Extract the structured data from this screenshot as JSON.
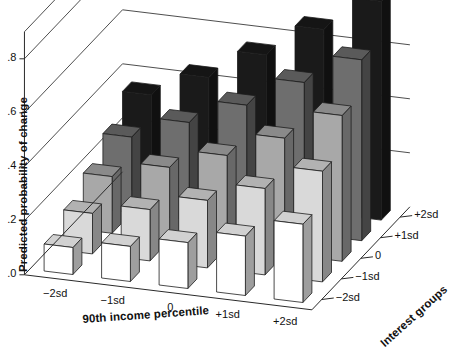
{
  "chart_data": {
    "type": "bar",
    "title": "",
    "subtitle": "",
    "projection": "3d",
    "xlabel": "90th income percentile",
    "ylabel": "Predicted probability of change",
    "zlabel": "Interest groups",
    "categories": [
      "−2sd",
      "−1sd",
      "0",
      "+1sd",
      "+2sd"
    ],
    "x_tick_labels": [
      "−2sd",
      "−1sd",
      "0",
      "+1sd",
      "+2sd"
    ],
    "z_tick_labels": [
      "−2sd",
      "−1sd",
      "0",
      "+1sd",
      "+2sd"
    ],
    "z_tick_labels_top_to_bottom": [
      "+2sd",
      "+1sd",
      "0",
      "−1sd",
      "−2sd"
    ],
    "y_tick_labels": [
      ".0",
      ".2",
      ".4",
      ".6",
      ".8"
    ],
    "y_tick_values": [
      0.0,
      0.2,
      0.4,
      0.6,
      0.8
    ],
    "ylim": [
      0.0,
      0.9
    ],
    "grid": true,
    "legend": "none",
    "series": [
      {
        "name": "−2sd",
        "depth_index": 0,
        "color": "#ffffff",
        "values": [
          0.1,
          0.13,
          0.17,
          0.22,
          0.29
        ]
      },
      {
        "name": "−1sd",
        "depth_index": 1,
        "color": "#d9d9d9",
        "values": [
          0.15,
          0.19,
          0.25,
          0.32,
          0.41
        ]
      },
      {
        "name": "0",
        "depth_index": 2,
        "color": "#a8a8a8",
        "values": [
          0.21,
          0.27,
          0.34,
          0.43,
          0.54
        ]
      },
      {
        "name": "+1sd",
        "depth_index": 3,
        "color": "#6e6e6e",
        "values": [
          0.28,
          0.36,
          0.45,
          0.56,
          0.67
        ]
      },
      {
        "name": "+2sd",
        "depth_index": 4,
        "color": "#1a1a1a",
        "values": [
          0.36,
          0.45,
          0.56,
          0.68,
          0.81
        ]
      }
    ]
  },
  "axes": {
    "y_title": "Predicted probability of change",
    "x_title": "90th income percentile",
    "z_title": "Interest groups"
  }
}
